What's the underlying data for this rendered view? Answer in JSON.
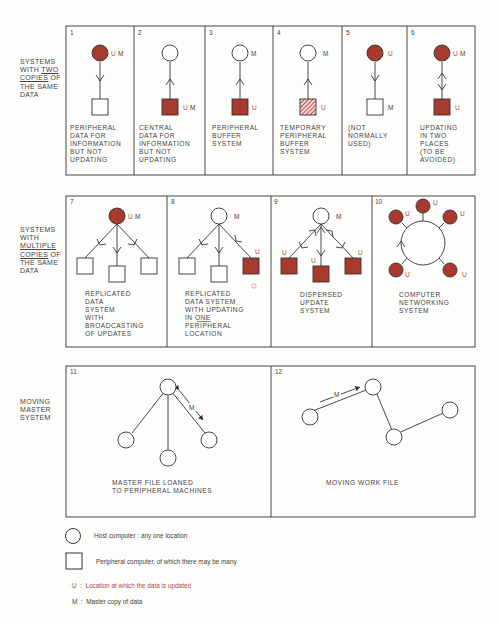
{
  "colors": {
    "update_fill": "#a8392f",
    "line": "#333333",
    "update_text": "#b04a40",
    "background": "#fdfdfc"
  },
  "section_labels": [
    {
      "lines": [
        "SYSTEMS",
        "WITH TWO",
        "COPIES OF",
        "THE SAME",
        "DATA"
      ],
      "underlined": [
        "TWO",
        "COPIES"
      ]
    },
    {
      "lines": [
        "SYSTEMS",
        "WITH",
        "MULTIPLE",
        "COPIES OF",
        "THE SAME",
        "DATA"
      ],
      "underlined": [
        "MULTIPLE",
        "COPIES"
      ]
    },
    {
      "lines": [
        "MOVING",
        "MASTER",
        "SYSTEM"
      ],
      "underlined": []
    }
  ],
  "panels": [
    {
      "number": "1",
      "caption": [
        "PERIPHERAL",
        "DATA FOR",
        "INFORMATION",
        "BUT NOT",
        "UPDATING"
      ],
      "host_labels": "U M",
      "peripheral_labels": ""
    },
    {
      "number": "2",
      "caption": [
        "CENTRAL",
        "DATA FOR",
        "INFORMATION",
        "BUT NOT",
        "UPDATING"
      ],
      "host_labels": "",
      "peripheral_labels": "U M"
    },
    {
      "number": "3",
      "caption": [
        "PERIPHERAL",
        "BUFFER",
        "SYSTEM"
      ],
      "host_labels": "M",
      "peripheral_labels": "U"
    },
    {
      "number": "4",
      "caption": [
        "TEMPORARY",
        "PERIPHERAL",
        "BUFFER",
        "SYSTEM"
      ],
      "host_labels": "M",
      "peripheral_labels": "U"
    },
    {
      "number": "5",
      "caption": [
        "(NOT",
        "NORMALLY",
        "USED)"
      ],
      "host_labels": "U",
      "peripheral_labels": "M"
    },
    {
      "number": "6",
      "caption": [
        "UPDATING",
        "IN TWO",
        "PLACES",
        "(TO BE",
        "AVOIDED)"
      ],
      "host_labels": "U M",
      "peripheral_labels": "U"
    },
    {
      "number": "7",
      "caption": [
        "REPLICATED",
        "DATA",
        "SYSTEM",
        "WITH",
        "BROADCASTING",
        "OF UPDATES"
      ],
      "host_labels": "U M"
    },
    {
      "number": "8",
      "caption": [
        "REPLICATED",
        "DATA SYSTEM",
        "WITH UPDATING",
        "IN ONE",
        "PERIPHERAL",
        "LOCATION"
      ],
      "host_labels": "M",
      "peripheral_labels": "U"
    },
    {
      "number": "9",
      "caption": [
        "DISPERSED",
        "UPDATE",
        "SYSTEM"
      ],
      "host_labels": "M",
      "peripheral_labels": "U"
    },
    {
      "number": "10",
      "caption": [
        "COMPUTER",
        "NETWORKING",
        "SYSTEM"
      ],
      "node_labels": "U"
    },
    {
      "number": "11",
      "caption": [
        "MASTER FILE LOANED",
        "TO PERIPHERAL MACHINES"
      ],
      "arrow_label": "M"
    },
    {
      "number": "12",
      "caption": [
        "MOVING WORK FILE"
      ],
      "arrow_label": "M"
    }
  ],
  "legend": {
    "host": "Host computer : any one location",
    "peripheral": "Peripheral computer, of which there may be many",
    "update": "U  :  Location at which the data is updated",
    "master": "M  :  Master copy of data"
  }
}
